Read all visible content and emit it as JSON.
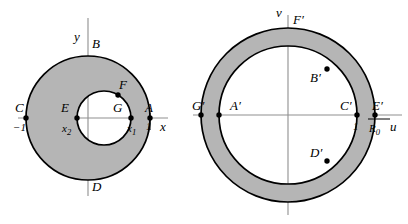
{
  "figure": {
    "background": "#ffffff",
    "annulus_fill": "#b5b5b5",
    "stroke": "#000000",
    "axis_stroke": "#8a8a8a"
  },
  "left_plane": {
    "axis_x_label": "x",
    "axis_y_label": "y",
    "points": [
      {
        "id": "A",
        "label": "A",
        "tick": "1",
        "x": 150,
        "y": 118
      },
      {
        "id": "B",
        "label": "B",
        "tick": "",
        "x": 88,
        "y": 56
      },
      {
        "id": "C",
        "label": "C",
        "tick": "−1",
        "x": 26,
        "y": 118
      },
      {
        "id": "D",
        "label": "D",
        "tick": "",
        "x": 88,
        "y": 180
      },
      {
        "id": "E",
        "label": "E",
        "tick": "x",
        "tick_sub": "2",
        "x": 77,
        "y": 118
      },
      {
        "id": "G",
        "label": "G",
        "tick": "x",
        "tick_sub": "1",
        "x": 131,
        "y": 118
      },
      {
        "id": "F",
        "label": "F",
        "tick": "",
        "x": 118,
        "y": 92
      }
    ],
    "outer_circle": {
      "cx": 88,
      "cy": 118,
      "r": 62
    },
    "inner_circle": {
      "cx": 104,
      "cy": 118,
      "r": 27
    }
  },
  "right_plane": {
    "axis_u_label": "u",
    "axis_v_label": "v",
    "points": [
      {
        "id": "Ap",
        "label": "A′",
        "tick": "",
        "x": 219,
        "y": 115
      },
      {
        "id": "Bp",
        "label": "B′",
        "tick": "",
        "x": 327,
        "y": 69
      },
      {
        "id": "Cp",
        "label": "C′",
        "tick": "1",
        "x": 357,
        "y": 115
      },
      {
        "id": "Dp",
        "label": "D′",
        "tick": "",
        "x": 327,
        "y": 161
      },
      {
        "id": "Ep",
        "label": "E′",
        "tick": "R",
        "tick_sub": "0",
        "x": 375,
        "y": 115
      },
      {
        "id": "Fp",
        "label": "F′",
        "tick": "",
        "x": 288,
        "y": 28
      },
      {
        "id": "Gp",
        "label": "G′",
        "tick": "",
        "x": 201,
        "y": 115
      }
    ],
    "outer_circle": {
      "cx": 288,
      "cy": 115,
      "r": 87
    },
    "inner_circle": {
      "cx": 288,
      "cy": 115,
      "r": 69
    }
  }
}
